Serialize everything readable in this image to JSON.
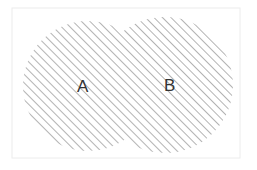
{
  "diagram": {
    "type": "venn",
    "universe": {
      "x": 12,
      "y": 8,
      "width": 228,
      "height": 150,
      "stroke": "#ececec"
    },
    "sets": [
      {
        "label": "A",
        "cx": 88,
        "cy": 86,
        "r": 65
      },
      {
        "label": "B",
        "cx": 165,
        "cy": 85,
        "r": 68
      }
    ],
    "shaded_region": "A ∪ B",
    "hatch_color": "#8a8a8a"
  }
}
